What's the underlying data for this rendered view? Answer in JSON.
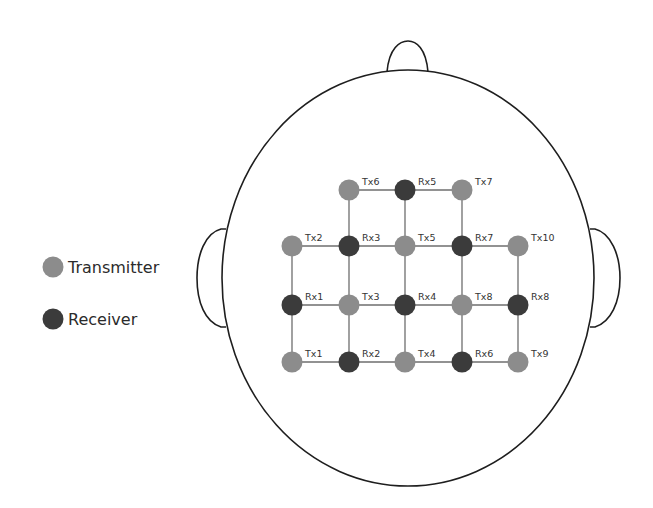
{
  "figure": {
    "title": ""
  },
  "colors": {
    "transmitter": "#8c8c8c",
    "receiver": "#3b3b3b",
    "connection": "#6e6e6e",
    "outline": "#1e1e1e",
    "label": "#333333"
  },
  "legend": {
    "items": [
      {
        "type": "transmitter",
        "label": "Transmitter"
      },
      {
        "type": "receiver",
        "label": "Receiver"
      }
    ]
  },
  "head": {
    "cx": 408,
    "cy": 278,
    "rx": 186,
    "ry": 208
  },
  "nodes": [
    {
      "id": "Tx6",
      "type": "transmitter",
      "x": 349,
      "y": 190
    },
    {
      "id": "Rx5",
      "type": "receiver",
      "x": 405,
      "y": 190
    },
    {
      "id": "Tx7",
      "type": "transmitter",
      "x": 462,
      "y": 190
    },
    {
      "id": "Tx2",
      "type": "transmitter",
      "x": 292,
      "y": 246
    },
    {
      "id": "Rx3",
      "type": "receiver",
      "x": 349,
      "y": 246
    },
    {
      "id": "Tx5",
      "type": "transmitter",
      "x": 405,
      "y": 246
    },
    {
      "id": "Rx7",
      "type": "receiver",
      "x": 462,
      "y": 246
    },
    {
      "id": "Tx10",
      "type": "transmitter",
      "x": 518,
      "y": 246
    },
    {
      "id": "Rx1",
      "type": "receiver",
      "x": 292,
      "y": 305
    },
    {
      "id": "Tx3",
      "type": "transmitter",
      "x": 349,
      "y": 305
    },
    {
      "id": "Rx4",
      "type": "receiver",
      "x": 405,
      "y": 305
    },
    {
      "id": "Tx8",
      "type": "transmitter",
      "x": 462,
      "y": 305
    },
    {
      "id": "Rx8",
      "type": "receiver",
      "x": 518,
      "y": 305
    },
    {
      "id": "Tx1",
      "type": "transmitter",
      "x": 292,
      "y": 362
    },
    {
      "id": "Rx2",
      "type": "receiver",
      "x": 349,
      "y": 362
    },
    {
      "id": "Tx4",
      "type": "transmitter",
      "x": 405,
      "y": 362
    },
    {
      "id": "Rx6",
      "type": "receiver",
      "x": 462,
      "y": 362
    },
    {
      "id": "Tx9",
      "type": "transmitter",
      "x": 518,
      "y": 362
    }
  ],
  "edges": [
    [
      "Tx6",
      "Rx5"
    ],
    [
      "Rx5",
      "Tx7"
    ],
    [
      "Tx6",
      "Rx3"
    ],
    [
      "Rx5",
      "Tx5"
    ],
    [
      "Tx7",
      "Rx7"
    ],
    [
      "Tx2",
      "Rx3"
    ],
    [
      "Rx3",
      "Tx5"
    ],
    [
      "Tx5",
      "Rx7"
    ],
    [
      "Rx7",
      "Tx10"
    ],
    [
      "Tx2",
      "Rx1"
    ],
    [
      "Rx3",
      "Tx3"
    ],
    [
      "Tx5",
      "Rx4"
    ],
    [
      "Rx7",
      "Tx8"
    ],
    [
      "Tx10",
      "Rx8"
    ],
    [
      "Rx1",
      "Tx3"
    ],
    [
      "Tx3",
      "Rx4"
    ],
    [
      "Rx4",
      "Tx8"
    ],
    [
      "Tx8",
      "Rx8"
    ],
    [
      "Rx1",
      "Tx1"
    ],
    [
      "Tx3",
      "Rx2"
    ],
    [
      "Rx4",
      "Tx4"
    ],
    [
      "Tx8",
      "Rx6"
    ],
    [
      "Rx8",
      "Tx9"
    ],
    [
      "Tx1",
      "Rx2"
    ],
    [
      "Rx2",
      "Tx4"
    ],
    [
      "Tx4",
      "Rx6"
    ],
    [
      "Rx6",
      "Tx9"
    ]
  ]
}
